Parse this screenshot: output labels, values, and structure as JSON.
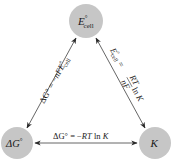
{
  "diagram": {
    "type": "triangle-relationship",
    "colors": {
      "node_fill": "#c6c6c6",
      "arrow": "#2a2a2a",
      "text": "#1a1a1a",
      "background": "#ffffff"
    },
    "nodes": {
      "top": {
        "symbol": "E",
        "superscript": "°",
        "subscript": "cell"
      },
      "bottom_left": {
        "symbol": "ΔG",
        "superscript": "°"
      },
      "bottom_right": {
        "symbol": "K"
      }
    },
    "edges": {
      "left": {
        "from": "top",
        "to": "bottom_left",
        "equation": "ΔG° = −nFE°cell",
        "lhs": "ΔG°",
        "eq": " = −",
        "n": "n",
        "F": "F",
        "E": "E",
        "sup": "°",
        "sub": "cell"
      },
      "right": {
        "from": "top",
        "to": "bottom_right",
        "equation": "E°cell = (RT/nF) ln K",
        "lhs_E": "E",
        "lhs_sup": "°",
        "lhs_sub": "cell",
        "eq": " = ",
        "num": "RT",
        "den": "nF",
        "ln": "ln",
        "K": "K"
      },
      "bottom": {
        "from": "bottom_left",
        "to": "bottom_right",
        "equation": "ΔG° = −RT ln K",
        "lhs": "ΔG°",
        "eq": " = −",
        "RT": "RT",
        "ln": " ln ",
        "K": "K"
      }
    }
  }
}
